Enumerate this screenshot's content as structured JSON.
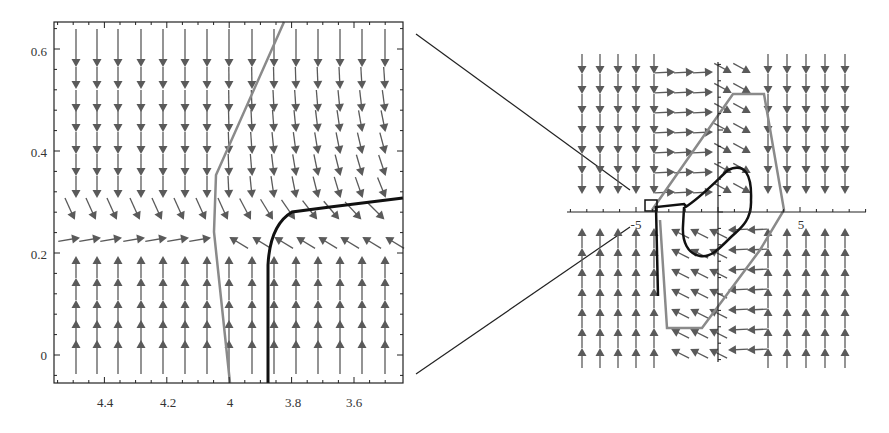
{
  "chart_data": [
    {
      "type": "vector_field",
      "panel": "left-zoom",
      "title": "",
      "xlabel": "",
      "ylabel": "",
      "x_reversed": true,
      "xlim": [
        4.56,
        3.445
      ],
      "ylim": [
        -0.055,
        0.657
      ],
      "x_ticks": [
        4.4,
        4.2,
        4,
        3.8,
        3.6
      ],
      "x_tick_labels": [
        "4.4",
        "4.2",
        "4",
        "3.8",
        "3.6"
      ],
      "y_ticks": [
        0,
        0.2,
        0.4,
        0.6
      ],
      "y_tick_labels": [
        "0",
        "0.2",
        "0.4",
        "0.6"
      ],
      "grid": false,
      "field_description": "Arrows point downward above y≈0.26 and upward below y≈0.24; near y≈0.25 arrows are horizontal/diagonal converging toward the nullcline.",
      "arrow_columns_x": [
        4.49,
        4.42,
        4.36,
        4.28,
        4.21,
        4.14,
        4.07,
        4.0,
        3.93,
        3.86,
        3.79,
        3.72,
        3.65,
        3.58,
        3.5
      ],
      "series": [
        {
          "name": "gray-curve",
          "color": "#8a8a8a",
          "points": [
            [
              3.87,
              0.657
            ],
            [
              4.05,
              0.36
            ],
            [
              4.04,
              0.26
            ],
            [
              4.0,
              -0.055
            ]
          ]
        },
        {
          "name": "black-trajectory",
          "color": "#111111",
          "points": [
            [
              3.87,
              -0.055
            ],
            [
              3.87,
              0.2
            ],
            [
              3.85,
              0.25
            ],
            [
              3.8,
              0.285
            ],
            [
              3.7,
              0.29
            ],
            [
              3.6,
              0.297
            ],
            [
              3.445,
              0.31
            ]
          ]
        }
      ]
    },
    {
      "type": "vector_field",
      "panel": "right-overview",
      "title": "",
      "xlabel": "",
      "ylabel": "",
      "xlim": [
        -9,
        9
      ],
      "ylim": [
        -9,
        9
      ],
      "x_ticks": [
        -5,
        5
      ],
      "x_tick_labels": [
        "-5",
        "5"
      ],
      "grid": false,
      "field_description": "Outer columns: arrows down above x-axis, up below. Central band: arrows point right above / left below, circulating around a closed orbit.",
      "series": [
        {
          "name": "gray-polygon",
          "color": "#8a8a8a",
          "points": [
            [
              -4,
              0.2
            ],
            [
              3,
              5.5
            ],
            [
              6,
              5.5
            ],
            [
              6.8,
              0.2
            ],
            [
              2.5,
              -4.5
            ],
            [
              -5.5,
              -9.5
            ],
            [
              -3,
              -9.5
            ]
          ]
        },
        {
          "name": "black-limit-cycle",
          "color": "#111111",
          "shape": "closed loop around origin, x≈[-4.5, 3], y≈[-5, 3.5]"
        },
        {
          "name": "black-trajectory",
          "color": "#111111",
          "points": [
            [
              -3.8,
              -4.5
            ],
            [
              -3.9,
              0.2
            ],
            [
              -1.8,
              0.4
            ],
            [
              -0.5,
              1.3
            ]
          ]
        },
        {
          "name": "zoom-box",
          "color": "#111111",
          "rect": [
            -4.1,
            0,
            0.6,
            0.6
          ]
        }
      ]
    }
  ],
  "left_panel": {
    "x_tick_labels": [
      "4.4",
      "4.2",
      "4",
      "3.8",
      "3.6"
    ],
    "y_tick_labels": [
      "0",
      "0.2",
      "0.4",
      "0.6"
    ]
  },
  "right_panel": {
    "x_tick_labels": [
      "-5",
      "5"
    ]
  },
  "colors": {
    "arrow": "#5a5a5a",
    "gray_curve": "#8a8a8a",
    "black_curve": "#111111",
    "frame": "#222222"
  }
}
